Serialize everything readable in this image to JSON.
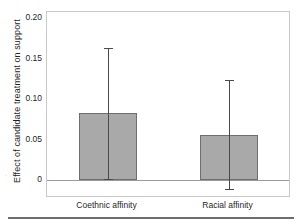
{
  "chart_data": {
    "type": "bar",
    "title": "",
    "subtitle": "",
    "xlabel": "",
    "ylabel": "Effect of candidate treatment on support",
    "categories": [
      "Coethnic affinity",
      "Racial affinity"
    ],
    "values": [
      0.083,
      0.056
    ],
    "errors_low": [
      0.001,
      -0.011
    ],
    "errors_high": [
      0.164,
      0.124
    ],
    "ylim": [
      -0.02,
      0.208
    ],
    "yticks": [
      0,
      0.05,
      0.1,
      0.15,
      0.2
    ],
    "ytick_labels": [
      "0",
      "0.05",
      "0.10",
      "0.15",
      "0.20"
    ],
    "grid": false,
    "legend": "none",
    "series": [
      {
        "name": "Effect of candidate treatment on support",
        "values": [
          0.083,
          0.056
        ],
        "ci_low": [
          0.001,
          -0.011
        ],
        "ci_high": [
          0.164,
          0.124
        ]
      }
    ],
    "colors": {
      "bar_fill": "#a9a9a9",
      "bar_edge": "#6e6e6e",
      "error_bar": "#4a4a4a",
      "axis_line": "#9a9a9a",
      "frame": "#c9c9c9",
      "text": "#1f1f1f",
      "background": "#ffffff",
      "footer_rule": "#6d6d6d"
    }
  }
}
